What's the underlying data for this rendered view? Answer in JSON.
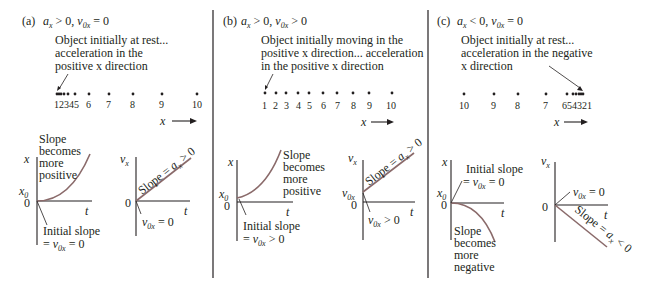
{
  "panels": [
    {
      "id": "a",
      "label": "(a)",
      "condition_a": "a",
      "condition_a_sub": "x",
      "condition_a_rel": " > 0, ",
      "condition_v": "v",
      "condition_v_sub": "0x",
      "condition_v_rel": " = 0",
      "description": [
        "Object initially at rest...",
        "acceleration in the",
        "positive x direction"
      ],
      "motion_numbers": [
        "1234",
        "5",
        "6",
        "7",
        "8",
        "9",
        "10"
      ],
      "axis_arrow_label": "x",
      "xt_graph": {
        "y_label": "x",
        "x_label": "t",
        "origin_labels": [
          "x0",
          "0"
        ],
        "curve_note": [
          "Slope",
          "becomes",
          "more",
          "positive"
        ],
        "initial_note": [
          "Initial slope",
          "= v0x = 0"
        ]
      },
      "vt_graph": {
        "y_label": "vx",
        "x_label": "t",
        "origin_label": "0",
        "slope_note": "Slope = ax > 0",
        "initial_note": "v0x = 0"
      }
    },
    {
      "id": "b",
      "label": "(b)",
      "condition_a": "a",
      "condition_a_sub": "x",
      "condition_a_rel": " > 0, ",
      "condition_v": "v",
      "condition_v_sub": "0x",
      "condition_v_rel": " > 0",
      "description": [
        "Object initially moving in the",
        "positive x direction... acceleration",
        "in the positive x direction"
      ],
      "motion_numbers": [
        "1",
        "2",
        "3",
        "4",
        "5",
        "6",
        "7",
        "8",
        "9",
        "10"
      ],
      "axis_arrow_label": "x",
      "xt_graph": {
        "y_label": "x",
        "x_label": "t",
        "origin_labels": [
          "x0",
          "0"
        ],
        "curve_note": [
          "Slope",
          "becomes",
          "more",
          "positive"
        ],
        "initial_note": [
          "Initial slope",
          "= v0x > 0"
        ]
      },
      "vt_graph": {
        "y_label": "vx",
        "x_label": "t",
        "origin_labels": [
          "v0x",
          "0"
        ],
        "slope_note": "Slope = ax > 0",
        "initial_note": "v0x > 0"
      }
    },
    {
      "id": "c",
      "label": "(c)",
      "condition_a": "a",
      "condition_a_sub": "x",
      "condition_a_rel": " < 0, ",
      "condition_v": "v",
      "condition_v_sub": "0x",
      "condition_v_rel": " = 0",
      "description": [
        "Object initially at rest...",
        "acceleration in the negative",
        "x direction"
      ],
      "motion_numbers": [
        "10",
        "9",
        "8",
        "7",
        "654321"
      ],
      "axis_arrow_label": "x",
      "xt_graph": {
        "y_label": "x",
        "x_label": "t",
        "origin_labels": [
          "x0",
          "0"
        ],
        "curve_note": [
          "Slope",
          "becomes",
          "more",
          "negative"
        ],
        "initial_note": [
          "Initial slope",
          "= v0x = 0"
        ]
      },
      "vt_graph": {
        "y_label": "vx",
        "x_label": "t",
        "origin_label": "0",
        "slope_note": "Slope = ax < 0",
        "initial_note": "v0x = 0"
      }
    }
  ]
}
